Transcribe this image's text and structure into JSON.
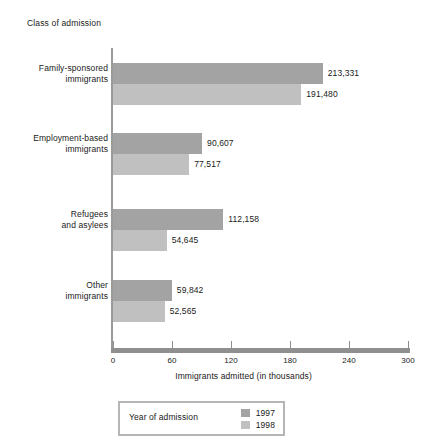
{
  "chart_data": {
    "type": "bar",
    "orientation": "horizontal",
    "title": "",
    "categories": [
      "Family-sponsored immigrants",
      "Employment-based immigrants",
      "Refugees and asylees",
      "Other immigrants"
    ],
    "category_lines": [
      [
        "Family-sponsored",
        "immigrants"
      ],
      [
        "Employment-based",
        "immigrants"
      ],
      [
        "Refugees",
        "and asylees"
      ],
      [
        "Other",
        "immigrants"
      ]
    ],
    "series": [
      {
        "name": "1997",
        "color": "#a3a3a3",
        "values": [
          213331,
          90607,
          112158,
          59842
        ],
        "labels": [
          "213,331",
          "90,607",
          "112,158",
          "59,842"
        ]
      },
      {
        "name": "1998",
        "color": "#c0c0c0",
        "values": [
          191480,
          77517,
          54645,
          52565
        ],
        "labels": [
          "191,480",
          "77,517",
          "54,645",
          "52,565"
        ]
      }
    ],
    "ylabel": "Class of admission",
    "xlabel": "Immigrants admitted (in thousands)",
    "xlim": [
      0,
      300
    ],
    "xticks": [
      0,
      60,
      120,
      180,
      240,
      300
    ],
    "xtick_labels": [
      "0",
      "60",
      "120",
      "180",
      "240",
      "300"
    ],
    "units_note": "values plotted in thousands",
    "grid": false,
    "legend": {
      "position": "below-axis",
      "title": "Year of admission",
      "entries": [
        "1997",
        "1998"
      ]
    }
  },
  "axis": {
    "y_title": "Class of admission",
    "x_title": "Immigrants admitted (in thousands)"
  },
  "legend": {
    "title": "Year of admission",
    "items": [
      {
        "label": "1997",
        "color": "#a3a3a3"
      },
      {
        "label": "1998",
        "color": "#c0c0c0"
      }
    ]
  },
  "colors": {
    "series_1997": "#a3a3a3",
    "series_1998": "#c0c0c0",
    "axis": "#8f8f8f",
    "legend_border": "#b5b5b5",
    "text": "#1a1a1a",
    "background": "#ffffff"
  }
}
